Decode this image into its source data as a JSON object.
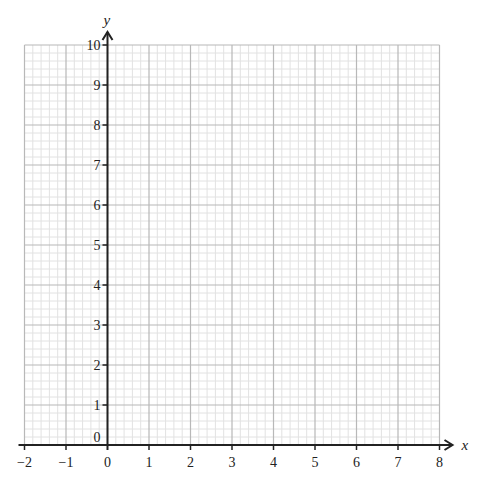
{
  "chart_data": {
    "type": "line",
    "title": "",
    "xlabel": "x",
    "ylabel": "y",
    "xlim": [
      -2,
      8
    ],
    "ylim": [
      0,
      10
    ],
    "x_ticks": [
      -2,
      -1,
      0,
      1,
      2,
      3,
      4,
      5,
      6,
      7,
      8
    ],
    "y_ticks": [
      0,
      1,
      2,
      3,
      4,
      5,
      6,
      7,
      8,
      9,
      10
    ],
    "x_tick_labels": [
      "−2",
      "−1",
      "0",
      "1",
      "2",
      "3",
      "4",
      "5",
      "6",
      "7",
      "8"
    ],
    "y_tick_labels": [
      "0",
      "1",
      "2",
      "3",
      "4",
      "5",
      "6",
      "7",
      "8",
      "9",
      "10"
    ],
    "grid": true,
    "minor_subdivisions": 5,
    "series": [],
    "legend": null
  },
  "colors": {
    "major_grid": "#b8b8b8",
    "minor_grid": "#e2e2e2",
    "axis": "#222222"
  },
  "layout": {
    "x0_px": 107.5,
    "y0_px": 445,
    "px_per_x": 41.5,
    "px_per_y": 40
  }
}
